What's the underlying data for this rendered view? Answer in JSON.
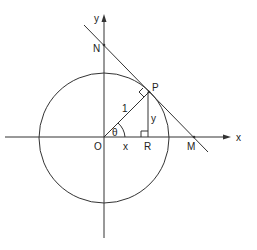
{
  "diagram": {
    "type": "unit-circle-tangent",
    "labels": {
      "x_axis": "x",
      "y_axis": "y",
      "origin": "O",
      "point_P": "P",
      "point_R": "R",
      "point_N": "N",
      "point_M": "M",
      "radius": "1",
      "angle": "θ",
      "horizontal_leg": "x",
      "vertical_leg": "y"
    },
    "geometry": {
      "origin": [
        104,
        137
      ],
      "circle_radius_px": 65,
      "P": [
        149,
        92
      ],
      "R": [
        149,
        137
      ],
      "N": [
        104,
        45
      ],
      "M": [
        194,
        137
      ]
    },
    "colors": {
      "line": "#333333",
      "text": "#222222",
      "background": "#ffffff"
    }
  }
}
